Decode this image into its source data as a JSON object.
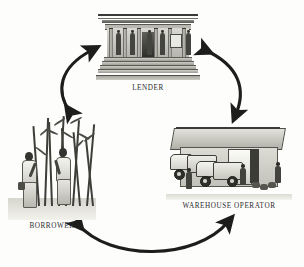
{
  "diagram": {
    "type": "cycle",
    "style": "grayscale line engraving",
    "background_color": "#fdfdfc",
    "ink_color": "#222222",
    "nodes": [
      {
        "id": "lender",
        "label": "LENDER",
        "position": "top-center",
        "illustration": "classical-bank-building-with-columns-and-steps"
      },
      {
        "id": "borrower",
        "label": "BORROWER",
        "position": "bottom-left",
        "illustration": "two-farmers-standing-in-sugarcane-field"
      },
      {
        "id": "warehouse_operator",
        "label": "WAREHOUSE OPERATOR",
        "position": "bottom-right",
        "illustration": "warehouse-shed-with-parked-trucks-and-workers"
      }
    ],
    "connectors": [
      {
        "id": "borrower-lender",
        "from": "borrower",
        "to": "lender",
        "direction": "bidirectional",
        "shape": "curved",
        "side": "left"
      },
      {
        "id": "lender-warehouse",
        "from": "lender",
        "to": "warehouse_operator",
        "direction": "bidirectional",
        "shape": "curved",
        "side": "right"
      },
      {
        "id": "borrower-warehouse",
        "from": "borrower",
        "to": "warehouse_operator",
        "direction": "bidirectional",
        "shape": "curved",
        "side": "bottom"
      }
    ]
  }
}
